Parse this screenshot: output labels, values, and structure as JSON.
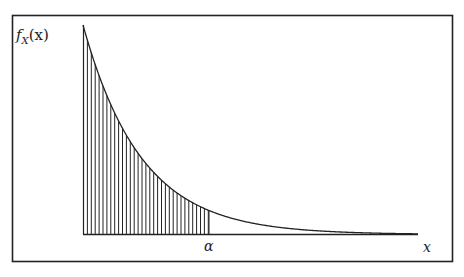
{
  "figure": {
    "y_label": "f",
    "y_label_sub": "X",
    "y_label_arg": "(x)",
    "x_label": "x",
    "threshold_label": "α",
    "colors": {
      "stroke": "#222222",
      "background": "#ffffff"
    }
  },
  "chart_data": {
    "type": "area",
    "title": "",
    "xlabel": "x",
    "ylabel": "f_X(x)",
    "curve": "exponential decay",
    "shaded_region": {
      "from": 0,
      "to": "α",
      "pattern": "vertical hatching"
    },
    "tick_labels": [
      "α"
    ],
    "grid": false,
    "legend": null
  }
}
